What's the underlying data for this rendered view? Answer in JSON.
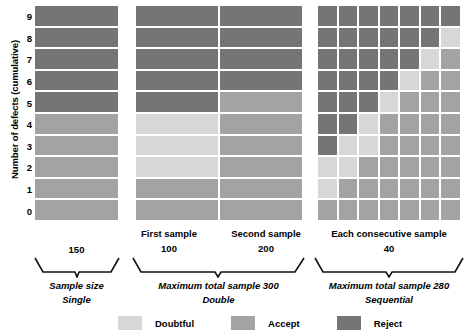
{
  "colors": {
    "doubtful": "#d7d7d7",
    "accept": "#a3a3a3",
    "reject": "#757575",
    "background": "#ffffff",
    "text": "#000000"
  },
  "axis": {
    "y_title": "Number of defects (cumulative)",
    "y_ticks": [
      "9",
      "8",
      "7",
      "6",
      "5",
      "4",
      "3",
      "2",
      "1",
      "0"
    ]
  },
  "legend": {
    "items": [
      {
        "label": "Doubtful",
        "color_key": "doubtful",
        "swatch_name": "legend-swatch-doubtful"
      },
      {
        "label": "Accept",
        "color_key": "accept",
        "swatch_name": "legend-swatch-accept"
      },
      {
        "label": "Reject",
        "color_key": "reject",
        "swatch_name": "legend-swatch-reject"
      }
    ]
  },
  "panels": [
    {
      "id": "single",
      "plan_name": "Single",
      "column_headers": [],
      "sample_numbers": [
        "150"
      ],
      "bracket_caption": "Sample size",
      "plan_label": "Single"
    },
    {
      "id": "double",
      "plan_name": "Double",
      "column_headers": [
        "First sample",
        "Second sample"
      ],
      "sample_numbers": [
        "100",
        "200"
      ],
      "bracket_caption": "Maximum total sample 300",
      "plan_label": "Double"
    },
    {
      "id": "sequential",
      "plan_name": "Sequential",
      "column_headers": [
        "Each consecutive sample"
      ],
      "sample_numbers": [
        "40"
      ],
      "bracket_caption": "Maximum total sample 280",
      "plan_label": "Sequential"
    }
  ],
  "chart_data": {
    "type": "heatmap",
    "title": "",
    "xlabel": "",
    "ylabel": "Number of defects (cumulative)",
    "categories": [
      "Single",
      "Double",
      "Sequential"
    ],
    "y_values": [
      9,
      8,
      7,
      6,
      5,
      4,
      3,
      2,
      1,
      0
    ],
    "value_legend": {
      "D": "Doubtful",
      "A": "Accept",
      "R": "Reject"
    },
    "grid": false,
    "legend_position": "bottom-center",
    "grids": {
      "single": {
        "columns": 1,
        "column_labels": [],
        "rows_top_to_bottom": [
          {
            "defects": 9,
            "cells": [
              "R"
            ]
          },
          {
            "defects": 8,
            "cells": [
              "R"
            ]
          },
          {
            "defects": 7,
            "cells": [
              "R"
            ]
          },
          {
            "defects": 6,
            "cells": [
              "R"
            ]
          },
          {
            "defects": 5,
            "cells": [
              "R"
            ]
          },
          {
            "defects": 4,
            "cells": [
              "A"
            ]
          },
          {
            "defects": 3,
            "cells": [
              "A"
            ]
          },
          {
            "defects": 2,
            "cells": [
              "A"
            ]
          },
          {
            "defects": 1,
            "cells": [
              "A"
            ]
          },
          {
            "defects": 0,
            "cells": [
              "A"
            ]
          }
        ]
      },
      "double": {
        "columns": 2,
        "column_labels": [
          "First sample",
          "Second sample"
        ],
        "rows_top_to_bottom": [
          {
            "defects": 9,
            "cells": [
              "R",
              "R"
            ]
          },
          {
            "defects": 8,
            "cells": [
              "R",
              "R"
            ]
          },
          {
            "defects": 7,
            "cells": [
              "R",
              "R"
            ]
          },
          {
            "defects": 6,
            "cells": [
              "R",
              "R"
            ]
          },
          {
            "defects": 5,
            "cells": [
              "R",
              "A"
            ]
          },
          {
            "defects": 4,
            "cells": [
              "D",
              "A"
            ]
          },
          {
            "defects": 3,
            "cells": [
              "D",
              "A"
            ]
          },
          {
            "defects": 2,
            "cells": [
              "D",
              "A"
            ]
          },
          {
            "defects": 1,
            "cells": [
              "A",
              "A"
            ]
          },
          {
            "defects": 0,
            "cells": [
              "A",
              "A"
            ]
          }
        ]
      },
      "sequential": {
        "columns": 7,
        "column_labels": [],
        "rows_top_to_bottom": [
          {
            "defects": 9,
            "cells": [
              "R",
              "R",
              "R",
              "R",
              "R",
              "R",
              "R"
            ]
          },
          {
            "defects": 8,
            "cells": [
              "R",
              "R",
              "R",
              "R",
              "R",
              "R",
              "D"
            ]
          },
          {
            "defects": 7,
            "cells": [
              "R",
              "R",
              "R",
              "R",
              "R",
              "D",
              "A"
            ]
          },
          {
            "defects": 6,
            "cells": [
              "R",
              "R",
              "R",
              "R",
              "D",
              "A",
              "A"
            ]
          },
          {
            "defects": 5,
            "cells": [
              "R",
              "R",
              "R",
              "D",
              "A",
              "A",
              "A"
            ]
          },
          {
            "defects": 4,
            "cells": [
              "R",
              "R",
              "D",
              "A",
              "A",
              "A",
              "A"
            ]
          },
          {
            "defects": 3,
            "cells": [
              "R",
              "D",
              "D",
              "A",
              "A",
              "A",
              "A"
            ]
          },
          {
            "defects": 2,
            "cells": [
              "D",
              "D",
              "A",
              "A",
              "A",
              "A",
              "A"
            ]
          },
          {
            "defects": 1,
            "cells": [
              "D",
              "A",
              "A",
              "A",
              "A",
              "A",
              "A"
            ]
          },
          {
            "defects": 0,
            "cells": [
              "A",
              "A",
              "A",
              "A",
              "A",
              "A",
              "A"
            ]
          }
        ]
      }
    }
  }
}
